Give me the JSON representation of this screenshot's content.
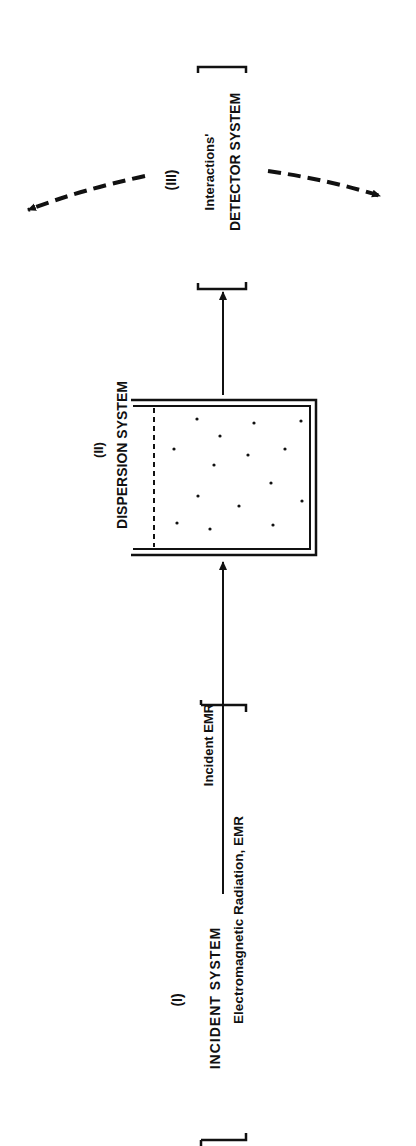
{
  "diagram": {
    "orientation": "rotated-90-ccw",
    "incident_system": {
      "numeral": "(I)",
      "title": "INCIDENT SYSTEM",
      "subtitle": "Electromagnetic Radiation, EMR"
    },
    "incident_arrow": {
      "label": "Incident EMR"
    },
    "dispersion_system": {
      "numeral": "(II)",
      "title": "DISPERSION SYSTEM"
    },
    "detector_system": {
      "numeral": "(III)",
      "subtitle": "Interactions'",
      "title": "DETECTOR SYSTEM"
    }
  }
}
